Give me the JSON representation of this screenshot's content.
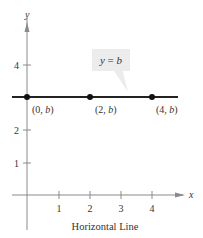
{
  "chart_data": {
    "type": "line",
    "title": "",
    "caption": "Horizontal Line",
    "xlabel": "x",
    "ylabel": "y",
    "x_ticks": [
      "1",
      "2",
      "3",
      "4"
    ],
    "y_ticks": [
      "1",
      "2",
      "4"
    ],
    "xlim": [
      -0.5,
      5.0
    ],
    "ylim": [
      -1.2,
      5.0
    ],
    "grid": false,
    "series": [
      {
        "name": "y = b",
        "equation": "y = b",
        "b_estimated": 3,
        "points": [
          {
            "x": 0,
            "y": 3,
            "label": "(0, b)"
          },
          {
            "x": 2,
            "y": 3,
            "label": "(2, b)"
          },
          {
            "x": 4,
            "y": 3,
            "label": "(4, b)"
          }
        ]
      }
    ],
    "annotations": [
      {
        "text": "y = b",
        "type": "callout",
        "points_to_x": 3.2
      }
    ]
  },
  "labels": {
    "x_axis": "x",
    "y_axis": "y",
    "tick_x1": "1",
    "tick_x2": "2",
    "tick_x3": "3",
    "tick_x4": "4",
    "tick_y1": "1",
    "tick_y2": "2",
    "tick_y4": "4",
    "callout": "y = b",
    "pt0": "(0, b)",
    "pt1": "(2, b)",
    "pt2": "(4, b)",
    "caption": "Horizontal Line"
  }
}
